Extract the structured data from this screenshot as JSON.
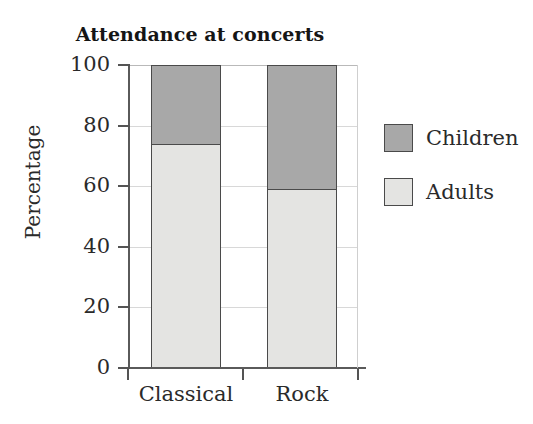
{
  "chart_data": {
    "type": "bar",
    "subtype": "stacked-bar-100-percent",
    "title": "Attendance at concerts",
    "xlabel": "",
    "ylabel": "Percentage",
    "categories": [
      "Classical",
      "Rock"
    ],
    "series": [
      {
        "name": "Adults",
        "values": [
          74,
          59
        ],
        "color": "#e4e4e2"
      },
      {
        "name": "Children",
        "values": [
          26,
          41
        ],
        "color": "#a8a8a8"
      }
    ],
    "stack_order_bottom_to_top": [
      "Adults",
      "Children"
    ],
    "ylim": [
      0,
      100
    ],
    "yticks": [
      0,
      20,
      40,
      60,
      80,
      100
    ],
    "ytick_labels": [
      "0",
      "20",
      "40",
      "60",
      "80",
      "100"
    ],
    "grid": true,
    "grid_axis": "y",
    "legend_position": "right",
    "legend_entries": [
      "Children",
      "Adults"
    ],
    "segment_tops": {
      "Classical": 74,
      "Rock": 59
    }
  },
  "colors": {
    "children": "#a8a8a8",
    "adults": "#e4e4e2",
    "outline": "#4a4a4a",
    "axis": "#5a5a5a",
    "gridline": "#d8d8d8",
    "text": "#2a2a2a",
    "background": "#ffffff"
  }
}
